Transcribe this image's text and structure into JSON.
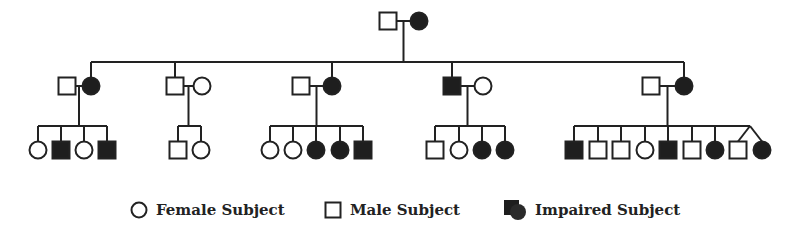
{
  "diagram": {
    "type": "pedigree",
    "colors": {
      "line": "#222222",
      "affected_fill": "#1e1e1e",
      "background": "#ffffff"
    },
    "generation_1": {
      "couple": [
        {
          "sex": "male",
          "affected": false
        },
        {
          "sex": "female",
          "affected": true
        }
      ]
    },
    "generation_2": [
      {
        "couple": [
          {
            "sex": "male",
            "affected": false
          },
          {
            "sex": "female",
            "affected": true
          }
        ],
        "blood_relative": "female",
        "children": [
          {
            "sex": "female",
            "affected": false
          },
          {
            "sex": "male",
            "affected": true
          },
          {
            "sex": "female",
            "affected": false
          },
          {
            "sex": "male",
            "affected": true
          }
        ]
      },
      {
        "couple": [
          {
            "sex": "male",
            "affected": false
          },
          {
            "sex": "female",
            "affected": false
          }
        ],
        "blood_relative": "male",
        "children": [
          {
            "sex": "male",
            "affected": false
          },
          {
            "sex": "female",
            "affected": false
          }
        ]
      },
      {
        "couple": [
          {
            "sex": "male",
            "affected": false
          },
          {
            "sex": "female",
            "affected": true
          }
        ],
        "blood_relative": "female",
        "children": [
          {
            "sex": "female",
            "affected": false
          },
          {
            "sex": "female",
            "affected": false
          },
          {
            "sex": "female",
            "affected": true
          },
          {
            "sex": "female",
            "affected": true
          },
          {
            "sex": "male",
            "affected": true
          }
        ]
      },
      {
        "couple": [
          {
            "sex": "male",
            "affected": true
          },
          {
            "sex": "female",
            "affected": false
          }
        ],
        "blood_relative": "male",
        "children": [
          {
            "sex": "male",
            "affected": false
          },
          {
            "sex": "female",
            "affected": false
          },
          {
            "sex": "female",
            "affected": true
          },
          {
            "sex": "female",
            "affected": true
          }
        ]
      },
      {
        "couple": [
          {
            "sex": "male",
            "affected": false
          },
          {
            "sex": "female",
            "affected": true
          }
        ],
        "blood_relative": "female",
        "children": [
          {
            "sex": "male",
            "affected": true
          },
          {
            "sex": "male",
            "affected": false
          },
          {
            "sex": "male",
            "affected": false
          },
          {
            "sex": "female",
            "affected": false
          },
          {
            "sex": "male",
            "affected": true
          },
          {
            "sex": "male",
            "affected": false
          },
          {
            "sex": "female",
            "affected": true
          },
          {
            "sex": "male",
            "affected": false,
            "twin": true
          },
          {
            "sex": "female",
            "affected": true,
            "twin": true
          }
        ]
      }
    ]
  },
  "legend": {
    "female_label": "Female Subject",
    "male_label": "Male Subject",
    "impaired_label": "Impaired Subject"
  }
}
